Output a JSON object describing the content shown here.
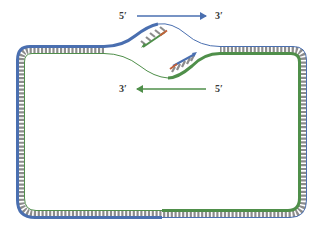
{
  "diagram": {
    "top_strand_direction": {
      "start_label": "5′",
      "end_label": "3′",
      "arrow": "right"
    },
    "bottom_strand_direction": {
      "start_label": "3′",
      "end_label": "5′",
      "arrow": "left"
    },
    "colors": {
      "blue_strand": "#4a6fb0",
      "green_strand": "#4f8f4a",
      "rungs": "#8c8c8c",
      "primer_red": "#c0603a",
      "primer_blue_arrow": "#4a6fb0",
      "primer_green_arrow": "#4f8f4a"
    },
    "elements": [
      "circular double-stranded DNA (rounded rectangle)",
      "replication bubble at top center",
      "upper fork strand (blue) with new green strand + rungs",
      "lower fork strand (green) with new blue strand + rungs"
    ]
  }
}
